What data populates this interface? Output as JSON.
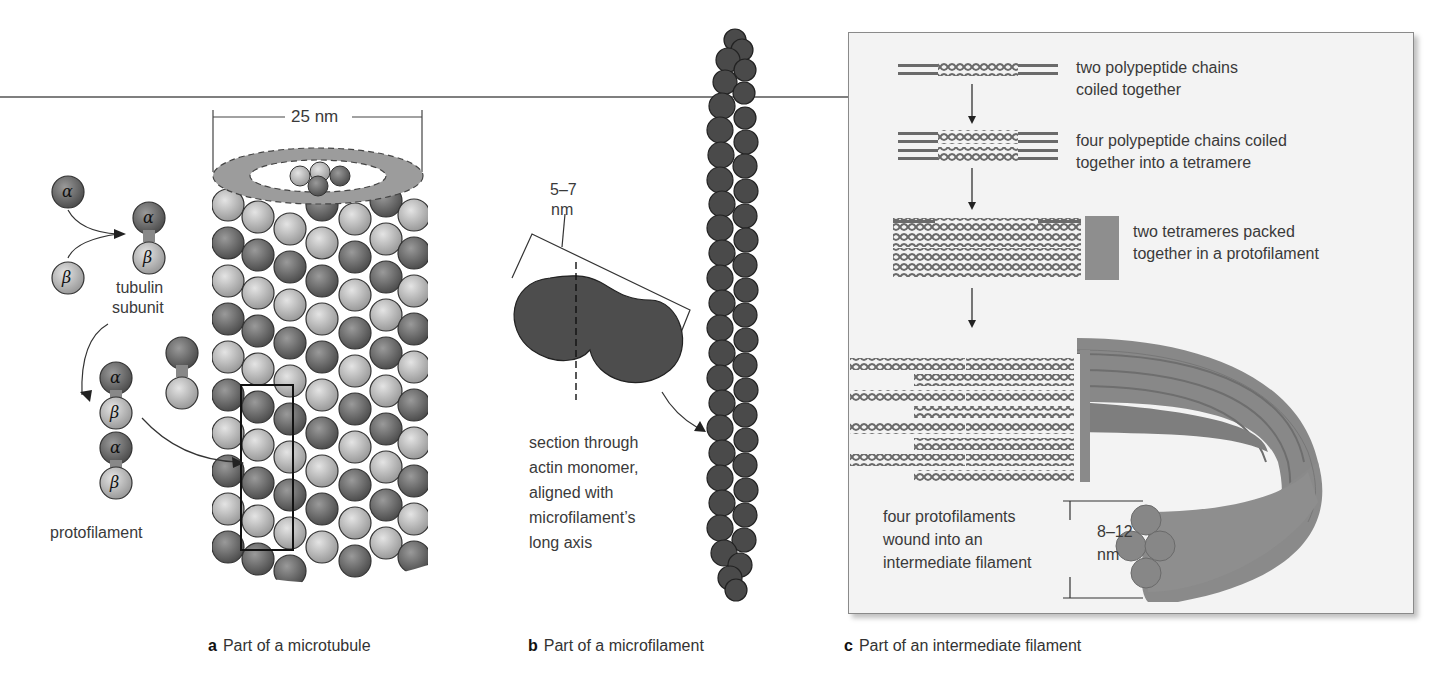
{
  "figure": {
    "colors": {
      "alpha_tubulin": "#6e6e6e",
      "beta_tubulin": "#b4b4b4",
      "actin": "#4a4a4a",
      "intermediate_filament": "#8c8c8c",
      "panel_c_background": "#f3f3f3",
      "ring_cap": "#9c9c9c"
    }
  },
  "panel_a": {
    "caption_letter": "a",
    "caption_text": "Part of a microtubule",
    "dimension_label": "25 nm",
    "alpha_symbol": "α",
    "beta_symbol": "β",
    "tubulin_label_line1": "tubulin",
    "tubulin_label_line2": "subunit",
    "protofilament_label": "protofilament"
  },
  "panel_b": {
    "caption_letter": "b",
    "caption_text": "Part of a microfilament",
    "dimension_line1": "5–7",
    "dimension_line2": "nm",
    "section_lines": [
      "section through",
      "actin monomer,",
      "aligned with",
      "microfilament’s",
      "long axis"
    ]
  },
  "panel_c": {
    "caption_letter": "c",
    "caption_text": "Part of an intermediate filament",
    "steps": [
      {
        "line1": "two polypeptide chains",
        "line2": "coiled together"
      },
      {
        "line1": "four polypeptide chains coiled",
        "line2": "together into a tetramere"
      },
      {
        "line1": "two tetrameres packed",
        "line2": "together in a protofilament"
      },
      {
        "line1": "four protofilaments",
        "line2": "wound into an",
        "line3": "intermediate filament"
      }
    ],
    "dimension_line1": "8–12",
    "dimension_line2": "nm"
  }
}
